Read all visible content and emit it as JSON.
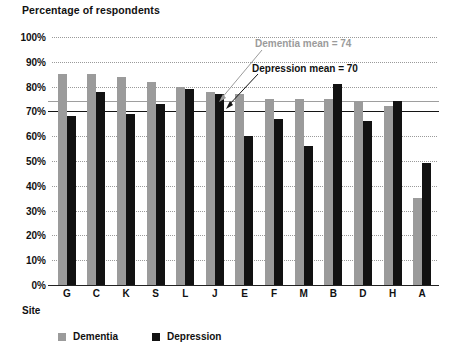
{
  "chart_data": {
    "type": "bar",
    "title": "Percentage of respondents",
    "xlabel": "Site",
    "ylabel": "",
    "ylim": [
      0,
      100
    ],
    "ytick_labels": [
      "100%",
      "90%",
      "80%",
      "70%",
      "60%",
      "50%",
      "40%",
      "30%",
      "20%",
      "10%",
      "0%"
    ],
    "ytick_values": [
      100,
      90,
      80,
      70,
      60,
      50,
      40,
      30,
      20,
      10,
      0
    ],
    "grid": true,
    "legend_position": "bottom-left",
    "categories": [
      "G",
      "C",
      "K",
      "S",
      "L",
      "J",
      "E",
      "F",
      "M",
      "B",
      "D",
      "H",
      "A"
    ],
    "series": [
      {
        "name": "Dementia",
        "color": "#9b9b9b",
        "values": [
          85,
          85,
          84,
          82,
          80,
          78,
          77,
          75,
          75,
          75,
          74,
          72,
          35
        ]
      },
      {
        "name": "Depression",
        "color": "#121212",
        "values": [
          68,
          78,
          69,
          73,
          79,
          77,
          60,
          67,
          56,
          81,
          66,
          74,
          49
        ]
      }
    ],
    "reference_lines": [
      {
        "name": "dementia-mean",
        "label": "Dementia mean = 74",
        "value": 74,
        "color": "#9b9b9b"
      },
      {
        "name": "depression-mean",
        "label": "Depression mean = 70",
        "value": 70,
        "color": "#121212"
      }
    ]
  }
}
